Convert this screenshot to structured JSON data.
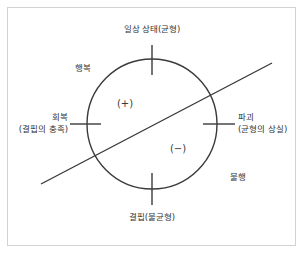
{
  "diagram": {
    "title_text": "",
    "frame": {
      "stroke": "#d2d2d2"
    },
    "circle": {
      "stroke": "#3a3a3a",
      "cx": 152,
      "cy": 124,
      "r": 65
    },
    "diagonal": {
      "stroke": "#3a3a3a",
      "x1": 41,
      "y1": 184,
      "x2": 272,
      "y2": 63
    },
    "labels": {
      "top": "일상 상태(균형)",
      "bottom": "결핍(불균형)",
      "left_main": "회복",
      "left_sub": "(결핍의 충족)",
      "right_main": "파괴",
      "right_sub": "(균형의 상실)",
      "upper_left": "행복",
      "lower_right": "불행"
    },
    "signs": {
      "positive": "(+)",
      "negative": "(−)"
    }
  }
}
